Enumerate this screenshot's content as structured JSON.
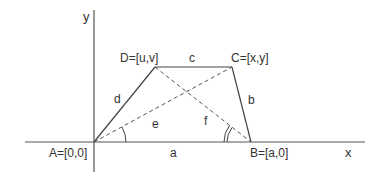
{
  "diagram": {
    "type": "geometry-trapezoid-on-axes",
    "colors": {
      "line": "#444444",
      "text": "#333333",
      "background": "#ffffff"
    },
    "axes": {
      "x_label": "x",
      "y_label": "y"
    },
    "points": {
      "A": {
        "label": "A=[0,0]"
      },
      "B": {
        "label": "B=[a,0]"
      },
      "C": {
        "label": "C=[x,y]"
      },
      "D": {
        "label": "D=[u,v]"
      }
    },
    "sides": {
      "a": "a",
      "b": "b",
      "c": "c",
      "d": "d"
    },
    "diagonals": {
      "e": "e",
      "f": "f"
    },
    "angles": [
      {
        "at": "A",
        "between": [
          "a",
          "e"
        ],
        "marks": 1
      },
      {
        "at": "B",
        "between": [
          "a",
          "f"
        ],
        "marks": 2
      }
    ]
  }
}
